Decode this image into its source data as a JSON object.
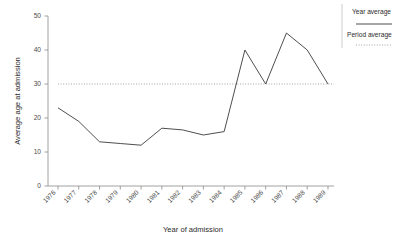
{
  "chart_data": {
    "type": "line",
    "title": "",
    "xlabel": "Year of admission",
    "ylabel": "Average age at admission",
    "categories": [
      "1976",
      "1977",
      "1978",
      "1979",
      "1980",
      "1981",
      "1982",
      "1983",
      "1984",
      "1985",
      "1986",
      "1987",
      "1988",
      "1989"
    ],
    "series": [
      {
        "name": "Year average",
        "style": "solid",
        "color": "#3a3a3a",
        "values": [
          23,
          19,
          13,
          12.5,
          12,
          17,
          16.5,
          15,
          16,
          40,
          30,
          45,
          40,
          30
        ]
      },
      {
        "name": "Period average",
        "style": "dotted",
        "color": "#9a9a9a",
        "constant_value": 30
      }
    ],
    "xlim": [
      1976,
      1989
    ],
    "ylim": [
      0,
      50
    ],
    "yticks": [
      0,
      10,
      20,
      30,
      40,
      50
    ],
    "ytick_labels": [
      "0",
      "10",
      "20",
      "30",
      "40",
      "50"
    ],
    "xtick_labels": [
      "1976",
      "1977",
      "1978",
      "1979",
      "1980",
      "1981",
      "1982",
      "1983",
      "1984",
      "1985",
      "1986",
      "1987",
      "1988",
      "1989"
    ],
    "grid": false,
    "legend_position": "right-top",
    "legend_entries": [
      {
        "label": "Year average",
        "style": "solid"
      },
      {
        "label": "Period average",
        "style": "dotted"
      }
    ]
  },
  "axes": {
    "y_title": "Average age at admission",
    "x_title": "Year of admission"
  },
  "legend": {
    "year_average_label": "Year average",
    "period_average_label": "Period average"
  },
  "ticks": {
    "y": [
      "0",
      "10",
      "20",
      "30",
      "40",
      "50"
    ],
    "x": [
      "1976",
      "1977",
      "1978",
      "1979",
      "1980",
      "1981",
      "1982",
      "1983",
      "1984",
      "1985",
      "1986",
      "1987",
      "1988",
      "1989"
    ]
  }
}
